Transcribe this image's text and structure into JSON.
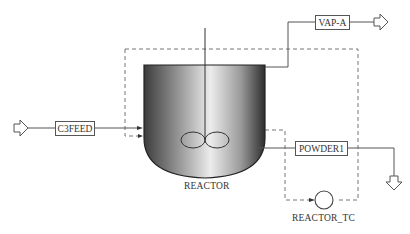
{
  "diagram": {
    "type": "process-flow-diagram",
    "blocks": {
      "reactor": {
        "label": "REACTOR"
      },
      "controller": {
        "label": "REACTOR_TC"
      }
    },
    "streams": {
      "feed": {
        "label": "C3FEED"
      },
      "vapor": {
        "label": "VAP-A"
      },
      "product": {
        "label": "POWDER1"
      }
    },
    "colors": {
      "line": "#555555",
      "dashed": "#777777",
      "vessel_dark": "#3a3a3a",
      "vessel_light": "#e8e8e8"
    }
  }
}
